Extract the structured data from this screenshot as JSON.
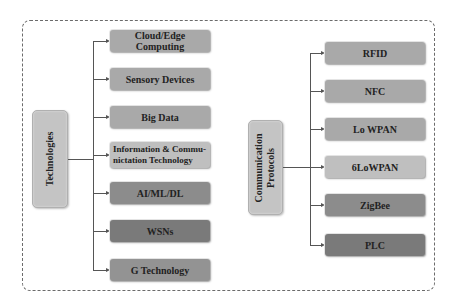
{
  "diagram": {
    "left_group": {
      "hub_label": "Technologies",
      "items": [
        {
          "label": "Cloud/Edge Computing",
          "color": "#a9a9a9"
        },
        {
          "label": "Sensory Devices",
          "color": "#a9a9a9"
        },
        {
          "label": "Big Data",
          "color": "#a9a9a9"
        },
        {
          "label": "Information & Commu-nictation Technology",
          "color": "#bfbfbf"
        },
        {
          "label": "AI/ML/DL",
          "color": "#8c8c8c"
        },
        {
          "label": "WSNs",
          "color": "#7a7a7a"
        },
        {
          "label": "G Technology",
          "color": "#939393"
        }
      ]
    },
    "right_group": {
      "hub_label_line1": "Communication",
      "hub_label_line2": "Protocols",
      "items": [
        {
          "label": "RFID",
          "color": "#a9a9a9"
        },
        {
          "label": "NFC",
          "color": "#a9a9a9"
        },
        {
          "label": "Lo WPAN",
          "color": "#a9a9a9"
        },
        {
          "label": "6LoWPAN",
          "color": "#bfbfbf"
        },
        {
          "label": "ZigBee",
          "color": "#8c8c8c"
        },
        {
          "label": "PLC",
          "color": "#7a7a7a"
        }
      ]
    },
    "colors": {
      "hub": "#c4c4c4",
      "connector": "#555555",
      "border": "#6b6b6b"
    }
  }
}
